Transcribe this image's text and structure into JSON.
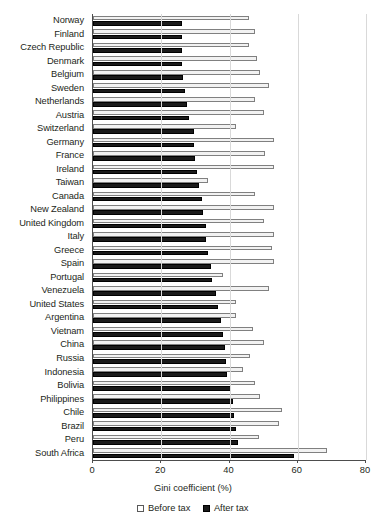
{
  "chart_data": {
    "type": "bar",
    "orientation": "horizontal",
    "title": "",
    "xlabel": "Gini coefficient (%)",
    "ylabel": "",
    "xlim": [
      0,
      80
    ],
    "xticks": [
      0,
      20,
      40,
      60,
      80
    ],
    "grid": true,
    "legend_position": "bottom",
    "categories": [
      "Norway",
      "Finland",
      "Czech Republic",
      "Denmark",
      "Belgium",
      "Sweden",
      "Netherlands",
      "Austria",
      "Switzerland",
      "Germany",
      "France",
      "Ireland",
      "Taiwan",
      "Canada",
      "New Zealand",
      "United Kingdom",
      "Italy",
      "Greece",
      "Spain",
      "Portugal",
      "Venezuela",
      "United States",
      "Argentina",
      "Vietnam",
      "China",
      "Russia",
      "Indonesia",
      "Bolivia",
      "Philippines",
      "Chile",
      "Brazil",
      "Peru",
      "South Africa"
    ],
    "series": [
      {
        "name": "Before tax",
        "color": "#f2f2f2",
        "values": [
          45.6,
          47.5,
          45.6,
          48.2,
          49.0,
          51.7,
          47.6,
          50.2,
          42.0,
          53.0,
          50.3,
          53.0,
          33.8,
          47.4,
          53.0,
          50.0,
          53.0,
          52.6,
          53.0,
          38.0,
          51.7,
          42.0,
          42.0,
          47.0,
          50.0,
          46.0,
          44.0,
          47.4,
          49.0,
          55.5,
          54.6,
          48.5,
          68.5
        ]
      },
      {
        "name": "After tax",
        "color": "#1a1a1a",
        "values": [
          26.0,
          26.1,
          26.1,
          26.2,
          26.5,
          27.0,
          27.6,
          28.2,
          29.5,
          29.5,
          29.8,
          30.6,
          31.0,
          32.0,
          32.3,
          33.0,
          33.2,
          33.6,
          34.6,
          35.0,
          36.0,
          36.6,
          37.5,
          38.0,
          38.6,
          39.0,
          39.4,
          40.3,
          41.0,
          41.2,
          42.0,
          42.4,
          58.8
        ]
      }
    ]
  },
  "axis": {
    "tick_labels": [
      "0",
      "20",
      "40",
      "60",
      "80"
    ],
    "title": "Gini coefficient (%)"
  },
  "legend": {
    "items": [
      {
        "label": "Before tax",
        "swatch": "open-square-swatch"
      },
      {
        "label": "After tax",
        "swatch": "filled-square-swatch"
      }
    ]
  }
}
